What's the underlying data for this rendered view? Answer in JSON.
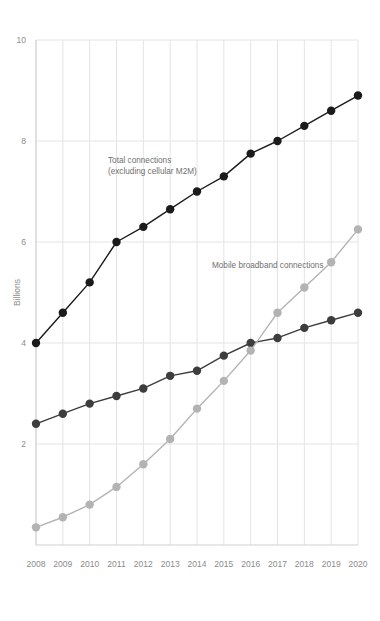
{
  "chart_data": {
    "type": "line",
    "title": "",
    "subtitle": "",
    "xlabel": "",
    "ylabel": "Billions",
    "x": [
      2008,
      2009,
      2010,
      2011,
      2012,
      2013,
      2014,
      2015,
      2016,
      2017,
      2018,
      2019,
      2020
    ],
    "xtick_labels": [
      "2008",
      "2009",
      "2010",
      "2011",
      "2012",
      "2013",
      "2014",
      "2015",
      "2016",
      "2017",
      "2018",
      "2019",
      "2020"
    ],
    "ytick_labels": [
      "2",
      "4",
      "6",
      "8",
      "10"
    ],
    "yticks": [
      2,
      4,
      6,
      8,
      10
    ],
    "ylim": [
      0,
      10
    ],
    "xlim": [
      2008,
      2020
    ],
    "grid": "vertical-and-horizontal",
    "legend_position": "inline-annotations",
    "series": [
      {
        "name": "Total connections (excluding cellular M2M)",
        "color": "#1b1b1b",
        "marker": "circle",
        "values": [
          4.0,
          4.6,
          5.2,
          6.0,
          6.3,
          6.65,
          7.0,
          7.3,
          7.75,
          8.0,
          8.3,
          8.6,
          8.9
        ]
      },
      {
        "name": "Unique subscribers",
        "color": "#3d3d3d",
        "marker": "circle",
        "values": [
          2.4,
          2.6,
          2.8,
          2.95,
          3.1,
          3.35,
          3.45,
          3.75,
          4.0,
          4.1,
          4.3,
          4.45,
          4.6
        ]
      },
      {
        "name": "Mobile broadband connections",
        "color": "#b3b3b3",
        "marker": "circle",
        "values": [
          0.35,
          0.55,
          0.8,
          1.15,
          1.6,
          2.1,
          2.7,
          3.25,
          3.85,
          4.6,
          5.1,
          5.6,
          6.25
        ]
      }
    ],
    "annotations": [
      {
        "id": "total-connections-label",
        "lines": [
          "Total connections",
          "(excluding cellular M2M)"
        ],
        "x": 108,
        "y": 163,
        "color": "#6f6f6f"
      },
      {
        "id": "mobile-broadband-label",
        "lines": [
          "Mobile broadband connections"
        ],
        "x": 212,
        "y": 268,
        "color": "#6f6f6f"
      }
    ],
    "colors": {
      "grid": "#e4e4e4",
      "axis": "#cfcfcf",
      "tick_text": "#8c8c8c",
      "background": "#ffffff"
    }
  }
}
